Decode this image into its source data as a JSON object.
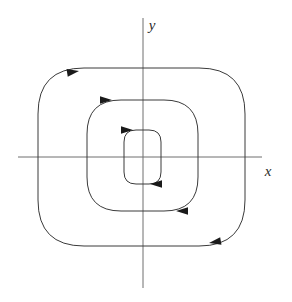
{
  "figure": {
    "width": 292,
    "height": 302,
    "background_color": "#ffffff"
  },
  "axes": {
    "x_axis": {
      "label": "x",
      "label_x": 268,
      "label_y": 176,
      "line_x1": 18,
      "line_x2": 262,
      "line_y": 157,
      "color": "#6e6e6e"
    },
    "y_axis": {
      "label": "y",
      "label_x": 152,
      "label_y": 30,
      "line_y1": 18,
      "line_y2": 288,
      "line_x": 143,
      "color": "#6e6e6e"
    },
    "origin": {
      "x": 143,
      "y": 157
    }
  },
  "orbits": [
    {
      "name": "inner-orbit",
      "index": 1,
      "direction": "clockwise",
      "stroke_color": "#3a3a3a",
      "bounds": {
        "left": 124,
        "right": 161,
        "top": 130,
        "bottom": 184
      },
      "corner_radius": 12,
      "path": "M 136 130 L 149 130 Q 161 130 161 142 L 161 172 Q 161 184 149 184 L 136 184 Q 124 184 124 172 L 124 142 Q 124 130 136 130 Z"
    },
    {
      "name": "middle-orbit",
      "index": 2,
      "direction": "clockwise",
      "stroke_color": "#3a3a3a",
      "bounds": {
        "left": 87,
        "right": 198,
        "top": 100,
        "bottom": 211
      },
      "corner_radius": 34,
      "path": "M 121 100 L 164 100 Q 198 100 198 134 L 198 177 Q 198 211 164 211 L 121 211 Q 87 211 87 177 L 87 134 Q 87 100 121 100 Z"
    },
    {
      "name": "outer-orbit",
      "index": 3,
      "direction": "clockwise",
      "stroke_color": "#3a3a3a",
      "bounds": {
        "left": 38,
        "right": 245,
        "top": 68,
        "bottom": 246
      },
      "corner_radius": 46,
      "path": "M 84 68 L 199 68 Q 245 68 245 114 L 245 200 Q 245 246 199 246 L 84 246 Q 38 246 38 200 L 38 114 Q 38 68 84 68 Z"
    }
  ],
  "arrows": [
    {
      "name": "inner-orbit-top-arrow",
      "orbit": "inner-orbit",
      "x": 133,
      "y": 130,
      "direction": "right",
      "angle": 0
    },
    {
      "name": "inner-orbit-bottom-arrow",
      "orbit": "inner-orbit",
      "x": 150,
      "y": 184,
      "direction": "left",
      "angle": 180
    },
    {
      "name": "middle-orbit-top-arrow",
      "orbit": "middle-orbit",
      "x": 112,
      "y": 100,
      "direction": "right",
      "angle": 0
    },
    {
      "name": "middle-orbit-bottom-arrow",
      "orbit": "middle-orbit",
      "x": 176,
      "y": 211,
      "direction": "left",
      "angle": 180
    },
    {
      "name": "outer-orbit-top-arrow",
      "orbit": "outer-orbit",
      "x": 79,
      "y": 71,
      "direction": "right",
      "angle": -9
    },
    {
      "name": "outer-orbit-bottom-arrow",
      "orbit": "outer-orbit",
      "x": 209,
      "y": 243,
      "direction": "left",
      "angle": 170
    }
  ],
  "colors": {
    "axis": "#6e6e6e",
    "orbit": "#3a3a3a",
    "arrow": "#1a1a1a",
    "label": "#2b2b2b"
  }
}
